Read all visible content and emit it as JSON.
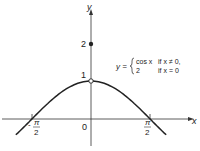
{
  "diagram": {
    "type": "function-graph",
    "axes": {
      "x_label": "x",
      "y_label": "y",
      "origin_label": "0"
    },
    "y_ticks": [
      {
        "value": 1,
        "label": "1"
      },
      {
        "value": 2,
        "label": "2"
      }
    ],
    "x_ticks": [
      {
        "value": "-pi/2",
        "sign": "-",
        "num": "π",
        "den": "2"
      },
      {
        "value": "pi/2",
        "sign": "",
        "num": "π",
        "den": "2"
      }
    ],
    "definition": {
      "lhs": "y =",
      "cases": [
        {
          "expr": "cos x",
          "cond": "if x ≠ 0,"
        },
        {
          "expr": "2",
          "cond": "if x = 0"
        }
      ]
    },
    "points": [
      {
        "x": 0,
        "y": 1,
        "style": "open"
      },
      {
        "x": 0,
        "y": 2,
        "style": "filled"
      }
    ],
    "curve": "cos x",
    "colors": {
      "stroke": "#222222",
      "background": "#ffffff"
    }
  }
}
